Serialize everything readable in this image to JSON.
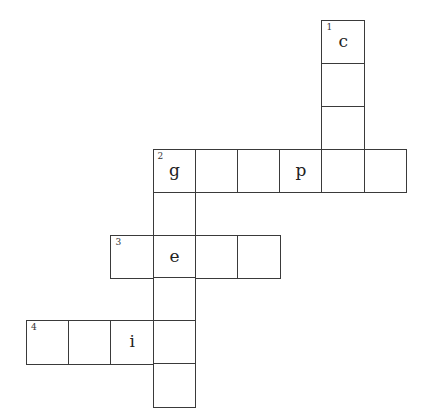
{
  "puzzle": {
    "origin": {
      "x": 26,
      "y": 20
    },
    "cell_w": 42.2,
    "cell_h": 42.9,
    "border_color": "#3a3a3a",
    "cells": [
      {
        "row": 0,
        "col": 7,
        "number": "1",
        "letter": "c"
      },
      {
        "row": 1,
        "col": 7,
        "number": "",
        "letter": ""
      },
      {
        "row": 2,
        "col": 7,
        "number": "",
        "letter": ""
      },
      {
        "row": 3,
        "col": 3,
        "number": "2",
        "letter": "g"
      },
      {
        "row": 3,
        "col": 4,
        "number": "",
        "letter": ""
      },
      {
        "row": 3,
        "col": 5,
        "number": "",
        "letter": ""
      },
      {
        "row": 3,
        "col": 6,
        "number": "",
        "letter": "p"
      },
      {
        "row": 3,
        "col": 7,
        "number": "",
        "letter": ""
      },
      {
        "row": 3,
        "col": 8,
        "number": "",
        "letter": ""
      },
      {
        "row": 4,
        "col": 3,
        "number": "",
        "letter": ""
      },
      {
        "row": 5,
        "col": 2,
        "number": "3",
        "letter": ""
      },
      {
        "row": 5,
        "col": 3,
        "number": "",
        "letter": "e"
      },
      {
        "row": 5,
        "col": 4,
        "number": "",
        "letter": ""
      },
      {
        "row": 5,
        "col": 5,
        "number": "",
        "letter": ""
      },
      {
        "row": 6,
        "col": 3,
        "number": "",
        "letter": ""
      },
      {
        "row": 7,
        "col": 0,
        "number": "4",
        "letter": ""
      },
      {
        "row": 7,
        "col": 1,
        "number": "",
        "letter": ""
      },
      {
        "row": 7,
        "col": 2,
        "number": "",
        "letter": "i"
      },
      {
        "row": 7,
        "col": 3,
        "number": "",
        "letter": ""
      },
      {
        "row": 8,
        "col": 3,
        "number": "",
        "letter": ""
      }
    ]
  }
}
